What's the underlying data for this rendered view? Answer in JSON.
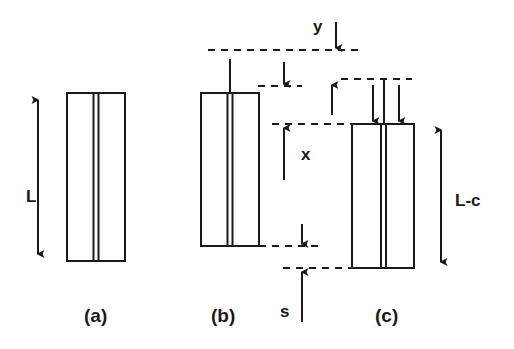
{
  "figure": {
    "type": "technical-line-diagram",
    "background_color": "#ffffff",
    "ink_color": "#1a1a1a",
    "panel_captions": [
      {
        "id": "a",
        "text": "(a)",
        "x": 84,
        "y": 306
      },
      {
        "id": "b",
        "text": "(b)",
        "x": 211,
        "y": 306
      },
      {
        "id": "c",
        "text": "(c)",
        "x": 375,
        "y": 306
      }
    ],
    "dimension_labels": [
      {
        "id": "L",
        "text": "L",
        "x": 26,
        "y": 188,
        "describes": "full specimen length of panel (a)"
      },
      {
        "id": "y",
        "text": "y",
        "x": 313,
        "y": 18,
        "describes": "downward offset at top dashed datum"
      },
      {
        "id": "x",
        "text": "x",
        "x": 301,
        "y": 146,
        "describes": "upward distance to panel (c) top datum"
      },
      {
        "id": "s",
        "text": "s",
        "x": 280,
        "y": 303,
        "describes": "gap between lower dashed datums"
      },
      {
        "id": "L-c",
        "text": "L-c",
        "x": 455,
        "y": 192,
        "describes": "reduced specimen length of panel (c)"
      }
    ],
    "panels": [
      {
        "id": "a",
        "name": "strip-a",
        "rect": {
          "x": 67,
          "y": 93,
          "width": 58,
          "height": 168
        },
        "center_seam": true,
        "stem": false,
        "top_arrows": 0
      },
      {
        "id": "b",
        "name": "strip-b",
        "rect": {
          "x": 201,
          "y": 93,
          "width": 58,
          "height": 153
        },
        "center_seam": true,
        "stem": true,
        "stem_top_y": 59,
        "top_arrows": 0
      },
      {
        "id": "c",
        "name": "strip-c",
        "rect": {
          "x": 352,
          "y": 124,
          "width": 62,
          "height": 144
        },
        "center_seam": true,
        "stem": true,
        "stem_top_y": 79,
        "top_arrows": 2
      }
    ],
    "datum_lines": [
      {
        "id": "datum-top",
        "y": 50,
        "x1": 208,
        "x2": 360,
        "style": "dashed"
      },
      {
        "id": "datum-second",
        "y": 86,
        "x1": 258,
        "x2": 300,
        "style": "dashed"
      },
      {
        "id": "datum-c-stem-top",
        "y": 79,
        "x1": 343,
        "x2": 412,
        "style": "dashed"
      },
      {
        "id": "datum-c-top",
        "y": 124,
        "x1": 272,
        "x2": 352,
        "style": "dashed"
      },
      {
        "id": "datum-b-bottom",
        "y": 246,
        "x1": 259,
        "x2": 320,
        "style": "dashed"
      },
      {
        "id": "datum-c-bottom",
        "y": 268,
        "x1": 283,
        "x2": 352,
        "style": "dashed"
      }
    ],
    "arrows": [
      {
        "id": "arrow-L",
        "kind": "double",
        "x1": 38,
        "y1": 96,
        "x2": 38,
        "y2": 258
      },
      {
        "id": "arrow-L-minus-c",
        "kind": "double",
        "x1": 441,
        "y1": 126,
        "x2": 441,
        "y2": 266
      },
      {
        "id": "arrow-y",
        "kind": "down",
        "x1": 336,
        "y1": 20,
        "x2": 336,
        "y2": 50
      },
      {
        "id": "arrow-second-down",
        "kind": "down",
        "x1": 284,
        "y1": 60,
        "x2": 284,
        "y2": 86
      },
      {
        "id": "arrow-x-up",
        "kind": "up",
        "x1": 284,
        "y1": 180,
        "x2": 284,
        "y2": 124
      },
      {
        "id": "arrow-c-stem-up",
        "kind": "up",
        "x1": 332,
        "y1": 115,
        "x2": 332,
        "y2": 82
      },
      {
        "id": "arrow-c-load-left",
        "kind": "down",
        "x1": 373,
        "y1": 83,
        "x2": 373,
        "y2": 124
      },
      {
        "id": "arrow-c-load-right",
        "kind": "down",
        "x1": 399,
        "y1": 83,
        "x2": 399,
        "y2": 124
      },
      {
        "id": "arrow-s-down",
        "kind": "down",
        "x1": 302,
        "y1": 222,
        "x2": 302,
        "y2": 246
      },
      {
        "id": "arrow-s-up",
        "kind": "up",
        "x1": 302,
        "y1": 320,
        "x2": 302,
        "y2": 268
      }
    ]
  }
}
